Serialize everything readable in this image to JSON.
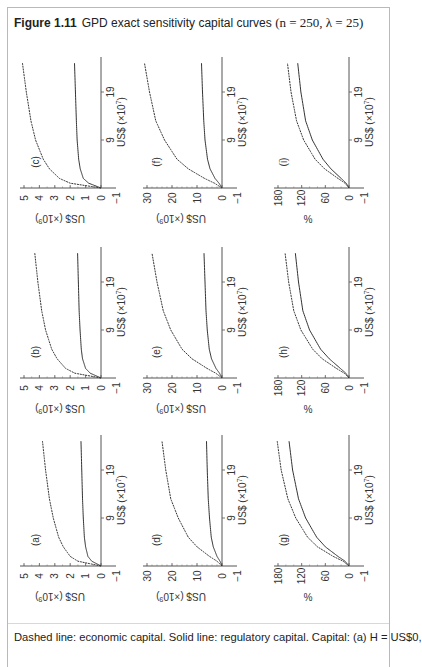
{
  "figure": {
    "label": "Figure 1.11",
    "title": "GPD exact sensitivity capital curves",
    "params": "(n = 250, λ = 25)"
  },
  "caption": "Dashed line: economic capital. Solid line: regulatory capital. Capital: (a) H = US$0,",
  "chart_data": [
    {
      "id": "a",
      "type": "line",
      "title": "(a)",
      "xlabel": "US$ (×10^7)",
      "ylabel": "US$ (×10^9)",
      "xticks": [
        -1,
        9,
        19
      ],
      "yticks": [
        -1,
        0,
        1,
        2,
        3,
        4,
        5
      ],
      "xlim": [
        -1,
        25
      ],
      "ylim": [
        -1,
        5
      ],
      "series": [
        {
          "name": "Economic capital (dashed)",
          "x": [
            -1,
            0,
            1,
            3,
            5,
            9,
            13,
            19,
            25
          ],
          "values": [
            0,
            1.5,
            2.0,
            2.45,
            2.75,
            3.1,
            3.35,
            3.6,
            3.8
          ]
        },
        {
          "name": "Regulatory capital (solid)",
          "x": [
            -1,
            0,
            1,
            3,
            5,
            9,
            13,
            19,
            25
          ],
          "values": [
            0,
            0.6,
            0.85,
            1.0,
            1.08,
            1.15,
            1.2,
            1.25,
            1.3
          ]
        }
      ]
    },
    {
      "id": "b",
      "type": "line",
      "title": "(b)",
      "xlabel": "US$ (×10^7)",
      "ylabel": "US$ (×10^9)",
      "xticks": [
        -1,
        9,
        19
      ],
      "yticks": [
        -1,
        0,
        1,
        2,
        3,
        4,
        5
      ],
      "xlim": [
        -1,
        25
      ],
      "ylim": [
        -1,
        5
      ],
      "series": [
        {
          "name": "Economic capital (dashed)",
          "x": [
            -1,
            0,
            1,
            3,
            5,
            9,
            13,
            19,
            25
          ],
          "values": [
            0,
            1.7,
            2.3,
            2.85,
            3.2,
            3.6,
            3.85,
            4.1,
            4.3
          ]
        },
        {
          "name": "Regulatory capital (solid)",
          "x": [
            -1,
            0,
            1,
            3,
            5,
            9,
            13,
            19,
            25
          ],
          "values": [
            0,
            0.7,
            1.0,
            1.2,
            1.28,
            1.36,
            1.42,
            1.47,
            1.52
          ]
        }
      ]
    },
    {
      "id": "c",
      "type": "line",
      "title": "(c)",
      "xlabel": "US$ (×10^7)",
      "ylabel": "US$ (×10^9)",
      "xticks": [
        -1,
        9,
        19
      ],
      "yticks": [
        -1,
        0,
        1,
        2,
        3,
        4,
        5
      ],
      "xlim": [
        -1,
        25
      ],
      "ylim": [
        -1,
        5
      ],
      "series": [
        {
          "name": "Economic capital (dashed)",
          "x": [
            -1,
            0,
            1,
            3,
            5,
            9,
            13,
            19,
            25
          ],
          "values": [
            0,
            2.0,
            2.7,
            3.35,
            3.75,
            4.25,
            4.55,
            4.85,
            5.1
          ]
        },
        {
          "name": "Regulatory capital (solid)",
          "x": [
            -1,
            0,
            1,
            3,
            5,
            9,
            13,
            19,
            25
          ],
          "values": [
            0,
            0.8,
            1.15,
            1.35,
            1.45,
            1.55,
            1.6,
            1.66,
            1.72
          ]
        }
      ]
    },
    {
      "id": "d",
      "type": "line",
      "title": "(d)",
      "xlabel": "US$ (×10^7)",
      "ylabel": "US$ (×10^9)",
      "xticks": [
        -1,
        9,
        19
      ],
      "yticks": [
        -1,
        0,
        10,
        20,
        30
      ],
      "xlim": [
        -1,
        25
      ],
      "ylim": [
        -1,
        35
      ],
      "series": [
        {
          "name": "Economic capital (dashed)",
          "x": [
            -1,
            0,
            1,
            3,
            5,
            9,
            13,
            19,
            25
          ],
          "values": [
            0,
            2,
            5,
            10,
            13.5,
            17.5,
            20.5,
            22.5,
            24
          ]
        },
        {
          "name": "Regulatory capital (solid)",
          "x": [
            -1,
            0,
            1,
            3,
            5,
            9,
            13,
            19,
            25
          ],
          "values": [
            0,
            0.8,
            2,
            3.5,
            4.3,
            5.0,
            5.5,
            5.9,
            6.2
          ]
        }
      ]
    },
    {
      "id": "e",
      "type": "line",
      "title": "(e)",
      "xlabel": "US$ (×10^7)",
      "ylabel": "US$ (×10^9)",
      "xticks": [
        -1,
        9,
        19
      ],
      "yticks": [
        -1,
        0,
        10,
        20,
        30
      ],
      "xlim": [
        -1,
        25
      ],
      "ylim": [
        -1,
        35
      ],
      "series": [
        {
          "name": "Economic capital (dashed)",
          "x": [
            -1,
            0,
            1,
            3,
            5,
            9,
            13,
            19,
            25
          ],
          "values": [
            0,
            2.5,
            6,
            12,
            16,
            20.5,
            23.5,
            26,
            28
          ]
        },
        {
          "name": "Regulatory capital (solid)",
          "x": [
            -1,
            0,
            1,
            3,
            5,
            9,
            13,
            19,
            25
          ],
          "values": [
            0,
            1,
            2.4,
            4.2,
            5.1,
            5.9,
            6.4,
            6.8,
            7.2
          ]
        }
      ]
    },
    {
      "id": "f",
      "type": "line",
      "title": "(f)",
      "xlabel": "US$ (×10^7)",
      "ylabel": "US$ (×10^9)",
      "xticks": [
        -1,
        9,
        19
      ],
      "yticks": [
        -1,
        0,
        10,
        20,
        30
      ],
      "xlim": [
        -1,
        25
      ],
      "ylim": [
        -1,
        35
      ],
      "series": [
        {
          "name": "Economic capital (dashed)",
          "x": [
            -1,
            0,
            1,
            3,
            5,
            9,
            13,
            19,
            25
          ],
          "values": [
            0,
            3,
            7,
            13.5,
            18,
            23,
            26.5,
            29,
            31
          ]
        },
        {
          "name": "Regulatory capital (solid)",
          "x": [
            -1,
            0,
            1,
            3,
            5,
            9,
            13,
            19,
            25
          ],
          "values": [
            0,
            1.2,
            2.8,
            4.8,
            5.8,
            6.8,
            7.3,
            7.8,
            8.2
          ]
        }
      ]
    },
    {
      "id": "g",
      "type": "line",
      "title": "(g)",
      "xlabel": "US$ (×10^7)",
      "ylabel": "%",
      "xticks": [
        -1,
        9,
        19
      ],
      "yticks": [
        0,
        60,
        120,
        180
      ],
      "xlim": [
        -1,
        25
      ],
      "ylim": [
        -10,
        195
      ],
      "series": [
        {
          "name": "Economic capital (dashed)",
          "x": [
            -1,
            0,
            1,
            3,
            5,
            9,
            13,
            19,
            25
          ],
          "values": [
            0,
            15,
            40,
            80,
            105,
            135,
            155,
            172,
            182
          ]
        },
        {
          "name": "Regulatory capital (solid)",
          "x": [
            -1,
            0,
            1,
            3,
            5,
            9,
            13,
            19,
            25
          ],
          "values": [
            0,
            10,
            28,
            60,
            82,
            110,
            128,
            143,
            152
          ]
        }
      ]
    },
    {
      "id": "h",
      "type": "line",
      "title": "(h)",
      "xlabel": "US$ (×10^7)",
      "ylabel": "%",
      "xticks": [
        -1,
        9,
        19
      ],
      "yticks": [
        0,
        60,
        120,
        180
      ],
      "xlim": [
        -1,
        25
      ],
      "ylim": [
        -10,
        195
      ],
      "series": [
        {
          "name": "Economic capital (dashed)",
          "x": [
            -1,
            0,
            1,
            3,
            5,
            9,
            13,
            19,
            25
          ],
          "values": [
            0,
            12,
            32,
            68,
            92,
            122,
            140,
            153,
            162
          ]
        },
        {
          "name": "Regulatory capital (solid)",
          "x": [
            -1,
            0,
            1,
            3,
            5,
            9,
            13,
            19,
            25
          ],
          "values": [
            0,
            8,
            22,
            50,
            72,
            100,
            117,
            128,
            136
          ]
        }
      ]
    },
    {
      "id": "i",
      "type": "line",
      "title": "(i)",
      "xlabel": "US$ (×10^7)",
      "ylabel": "%",
      "xticks": [
        -1,
        9,
        19
      ],
      "yticks": [
        0,
        60,
        120,
        180
      ],
      "xlim": [
        -1,
        25
      ],
      "ylim": [
        -10,
        195
      ],
      "series": [
        {
          "name": "Economic capital (dashed)",
          "x": [
            -1,
            0,
            1,
            3,
            5,
            9,
            13,
            19,
            25
          ],
          "values": [
            0,
            10,
            28,
            62,
            86,
            115,
            133,
            147,
            156
          ]
        },
        {
          "name": "Regulatory capital (solid)",
          "x": [
            -1,
            0,
            1,
            3,
            5,
            9,
            13,
            19,
            25
          ],
          "values": [
            0,
            7,
            20,
            46,
            66,
            93,
            110,
            122,
            130
          ]
        }
      ]
    }
  ],
  "layout": {
    "rotation": "figure rotated 90° counter-clockwise",
    "grid": false,
    "legend": "none (described in caption)",
    "panel_grid": [
      [
        "c",
        "f",
        "i"
      ],
      [
        "b",
        "e",
        "h"
      ],
      [
        "a",
        "d",
        "g"
      ]
    ]
  }
}
